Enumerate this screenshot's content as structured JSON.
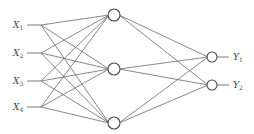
{
  "diagram": {
    "type": "neural-network",
    "colors": {
      "line": "#6a6a6a",
      "node_stroke": "#4a4a4a",
      "text": "#444444",
      "background": "#ffffff"
    },
    "inputs": [
      {
        "label": "X",
        "sub": "1",
        "y": 25
      },
      {
        "label": "X",
        "sub": "2",
        "y": 53
      },
      {
        "label": "X",
        "sub": "3",
        "y": 81
      },
      {
        "label": "X",
        "sub": "4",
        "y": 107
      }
    ],
    "hidden": [
      {
        "y": 15
      },
      {
        "y": 69
      },
      {
        "y": 123
      }
    ],
    "outputs": [
      {
        "label": "Y",
        "sub": "1",
        "y": 57
      },
      {
        "label": "Y",
        "sub": "2",
        "y": 85
      }
    ],
    "layout": {
      "input_label_x": 13,
      "input_line_start_x": 27,
      "input_branch_x": 41,
      "hidden_x": 114,
      "hidden_r": 6,
      "output_x": 212,
      "output_r": 5,
      "output_line_end_x": 229,
      "output_label_x": 233
    }
  }
}
